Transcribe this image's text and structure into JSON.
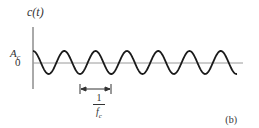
{
  "figure": {
    "panel_label": "(b)",
    "y_axis_label": "c(t)",
    "amplitude_label": "A",
    "amplitude_subscript": "c",
    "zero_label": "0",
    "period_annotation": {
      "numerator": "1",
      "denominator": "f",
      "denominator_subscript": "c"
    },
    "signal": "cosine carrier wave, c(t) = A_c cos(2π f_c t)",
    "cycles_shown": 6.6
  },
  "colors": {
    "wave": "#1a1a1a",
    "axis": "#555555",
    "zero_line": "#9a9a9a",
    "text": "#333333"
  }
}
